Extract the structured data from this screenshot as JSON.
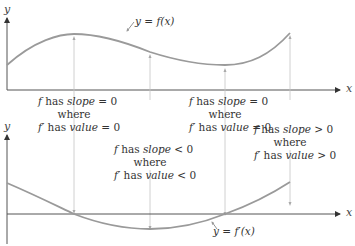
{
  "diagram": {
    "top_graph": {
      "y_axis_label": "y",
      "x_axis_label": "x",
      "curve_label": "y = f(x)"
    },
    "bottom_graph": {
      "y_axis_label": "y",
      "x_axis_label": "x",
      "curve_label": "y = f′(x)"
    },
    "annotations": [
      {
        "line1_a": "f",
        "line1_b": " has ",
        "line1_c": "slope",
        "line1_d": " = 0",
        "line2": "where",
        "line3_a": "f′",
        "line3_b": " has ",
        "line3_c": "value",
        "line3_d": " = 0"
      },
      {
        "line1_a": "f",
        "line1_b": " has ",
        "line1_c": "slope",
        "line1_d": " < 0",
        "line2": "where",
        "line3_a": "f′",
        "line3_b": " has ",
        "line3_c": "value",
        "line3_d": " < 0"
      },
      {
        "line1_a": "f",
        "line1_b": " has ",
        "line1_c": "slope",
        "line1_d": " = 0",
        "line2": "where",
        "line3_a": "f′",
        "line3_b": " has ",
        "line3_c": "value",
        "line3_d": " = 0"
      },
      {
        "line1_a": "f",
        "line1_b": " has ",
        "line1_c": "slope",
        "line1_d": " > 0",
        "line2": "where",
        "line3_a": "f′",
        "line3_b": " has ",
        "line3_c": "value",
        "line3_d": " > 0"
      }
    ],
    "colors": {
      "curve": "#9a9a9a",
      "axis": "#555555",
      "guide": "#bdbdbd"
    }
  }
}
